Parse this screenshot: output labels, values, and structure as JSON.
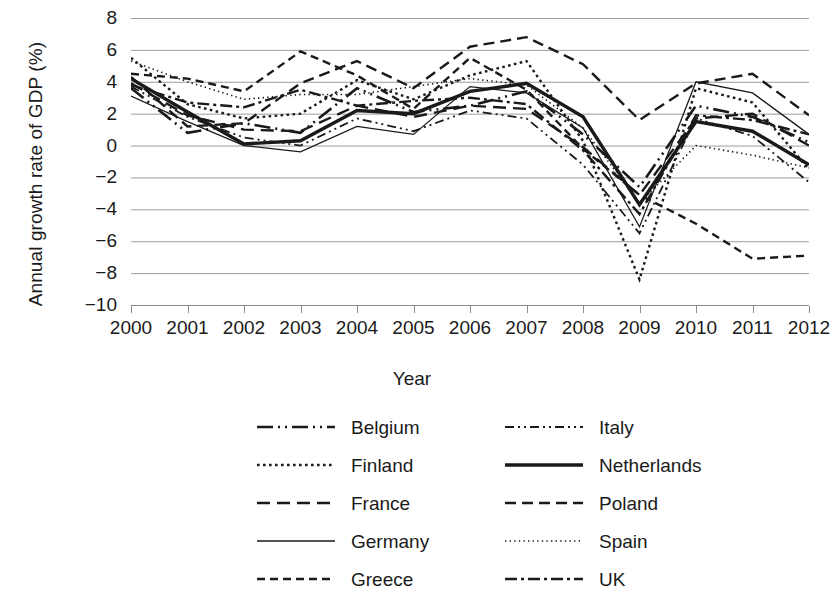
{
  "chart_data": {
    "type": "line",
    "title": "",
    "xlabel": "Year",
    "ylabel": "Annual growth rate of GDP (%)",
    "categories": [
      2000,
      2001,
      2002,
      2003,
      2004,
      2005,
      2006,
      2007,
      2008,
      2009,
      2010,
      2011,
      2012
    ],
    "xticklabels": [
      "2000",
      "2001",
      "2002",
      "2003",
      "2004",
      "2005",
      "2006",
      "2007",
      "2008",
      "2009",
      "2010",
      "2011",
      "2012"
    ],
    "yticklabels": [
      "8",
      "6",
      "4",
      "2",
      "0",
      "−2",
      "−4",
      "−6",
      "−8",
      "−10"
    ],
    "ytickvalues": [
      8,
      6,
      4,
      2,
      0,
      -2,
      -4,
      -6,
      -8,
      -10
    ],
    "ylim": [
      -10,
      8
    ],
    "xlim": [
      2000,
      2012
    ],
    "grid": "horizontal",
    "legend_position": "bottom",
    "legend_columns": 2,
    "series": [
      {
        "name": "Belgium",
        "dash": "long-dash-dot-dot",
        "width": 2.6,
        "color": "#1a1a1a",
        "values": [
          3.6,
          0.8,
          1.4,
          0.8,
          3.6,
          2.1,
          2.5,
          3.4,
          0.7,
          -2.6,
          2.5,
          1.8,
          0.2
        ]
      },
      {
        "name": "Finland",
        "dash": "dotted-medium",
        "width": 2.4,
        "color": "#1a1a1a",
        "values": [
          5.5,
          2.6,
          1.7,
          2.0,
          4.1,
          2.9,
          4.4,
          5.3,
          0.3,
          -8.4,
          3.6,
          2.7,
          -1.5
        ]
      },
      {
        "name": "France",
        "dash": "long-dash",
        "width": 2.4,
        "color": "#1a1a1a",
        "values": [
          3.9,
          1.9,
          1.0,
          0.9,
          2.5,
          1.8,
          2.5,
          2.3,
          -0.1,
          -3.1,
          1.7,
          2.0,
          0.0
        ]
      },
      {
        "name": "Germany",
        "dash": "solid-thin",
        "width": 1.3,
        "color": "#1a1a1a",
        "values": [
          3.1,
          1.5,
          0.0,
          -0.4,
          1.2,
          0.7,
          3.7,
          3.3,
          1.1,
          -5.1,
          4.0,
          3.3,
          0.7
        ]
      },
      {
        "name": "Greece",
        "dash": "dash-medium",
        "width": 2.4,
        "color": "#1a1a1a",
        "values": [
          4.5,
          4.2,
          3.4,
          5.9,
          4.4,
          2.3,
          5.5,
          3.5,
          -0.2,
          -3.1,
          -4.9,
          -7.1,
          -6.9
        ]
      },
      {
        "name": "Italy",
        "dash": "dash-dot-dot",
        "width": 1.8,
        "color": "#1a1a1a",
        "values": [
          3.7,
          1.8,
          0.5,
          0.0,
          1.7,
          0.9,
          2.2,
          1.7,
          -1.2,
          -5.5,
          1.7,
          0.6,
          -2.3
        ]
      },
      {
        "name": "Netherlands",
        "dash": "solid-thick",
        "width": 3.4,
        "color": "#1a1a1a",
        "values": [
          4.2,
          2.1,
          0.1,
          0.3,
          2.2,
          2.0,
          3.4,
          3.9,
          1.8,
          -3.7,
          1.5,
          0.9,
          -1.2
        ]
      },
      {
        "name": "Poland",
        "dash": "dash-long-even",
        "width": 2.4,
        "color": "#1a1a1a",
        "values": [
          4.3,
          1.2,
          1.4,
          3.9,
          5.3,
          3.6,
          6.2,
          6.8,
          5.1,
          1.6,
          3.9,
          4.5,
          1.9
        ]
      },
      {
        "name": "Spain",
        "dash": "dotted-fine",
        "width": 1.6,
        "color": "#1a1a1a",
        "values": [
          5.3,
          4.0,
          2.9,
          3.2,
          3.2,
          3.7,
          4.2,
          3.8,
          1.1,
          -3.6,
          0.0,
          -0.6,
          -1.4
        ]
      },
      {
        "name": "UK",
        "dash": "dash-dot",
        "width": 2.4,
        "color": "#1a1a1a",
        "values": [
          3.8,
          2.7,
          2.4,
          3.5,
          2.5,
          2.8,
          3.0,
          2.6,
          -0.3,
          -4.3,
          1.9,
          1.6,
          0.7
        ]
      }
    ]
  },
  "legend": {
    "columns": [
      [
        "Belgium",
        "Finland",
        "France",
        "Germany",
        "Greece"
      ],
      [
        "Italy",
        "Netherlands",
        "Poland",
        "Spain",
        "UK"
      ]
    ]
  },
  "style": {
    "axis_color": "#8a8a8a",
    "grid_color": "#9b9b9b",
    "line_color": "#1a1a1a",
    "background": "#ffffff",
    "text_color": "#1a1a1a"
  }
}
